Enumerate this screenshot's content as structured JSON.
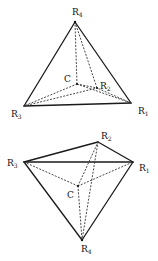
{
  "figures": [
    {
      "name": "tetrahedron-top",
      "vertices": {
        "R1": {
          "label": "R",
          "sub": "1",
          "x": 131,
          "y": 103
        },
        "R2": {
          "label": "R",
          "sub": "2",
          "x": 97,
          "y": 88
        },
        "R3": {
          "label": "R",
          "sub": "3",
          "x": 24,
          "y": 106
        },
        "R4": {
          "label": "R",
          "sub": "4",
          "x": 75,
          "y": 22
        },
        "C": {
          "label": "C",
          "x": 77,
          "y": 84
        }
      }
    },
    {
      "name": "tetrahedron-bottom",
      "vertices": {
        "R1": {
          "label": "R",
          "sub": "1",
          "x": 133,
          "y": 162
        },
        "R2": {
          "label": "R",
          "sub": "2",
          "x": 98,
          "y": 142
        },
        "R3": {
          "label": "R",
          "sub": "3",
          "x": 24,
          "y": 162
        },
        "R4": {
          "label": "R",
          "sub": "4",
          "x": 82,
          "y": 240
        },
        "C": {
          "label": "C",
          "x": 78,
          "y": 186
        }
      }
    }
  ],
  "colors": {
    "line": "#1a1a1a",
    "background": "#ffffff"
  }
}
